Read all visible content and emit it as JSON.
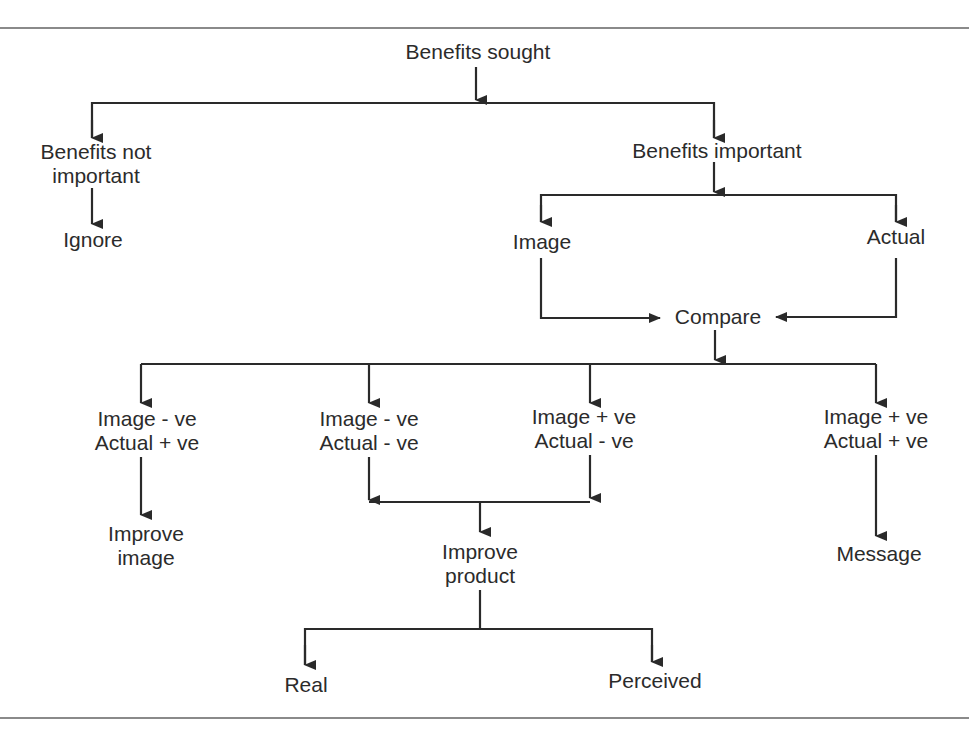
{
  "diagram": {
    "title": "Benefits sought",
    "nodes": {
      "benefits_sought": "Benefits sought",
      "not_important_1": "Benefits not",
      "not_important_2": "important",
      "ignore": "Ignore",
      "important": "Benefits important",
      "image": "Image",
      "actual": "Actual",
      "compare": "Compare",
      "c1_line1": "Image - ve",
      "c1_line2": "Actual + ve",
      "c2_line1": "Image - ve",
      "c2_line2": "Actual - ve",
      "c3_line1": "Image + ve",
      "c3_line2": "Actual - ve",
      "c4_line1": "Image + ve",
      "c4_line2": "Actual + ve",
      "improve_image_1": "Improve",
      "improve_image_2": "image",
      "improve_product_1": "Improve",
      "improve_product_2": "product",
      "message": "Message",
      "real": "Real",
      "perceived": "Perceived"
    },
    "colors": {
      "line": "#2a2a2a",
      "rule": "#8a8a8a",
      "background": "#ffffff"
    }
  }
}
